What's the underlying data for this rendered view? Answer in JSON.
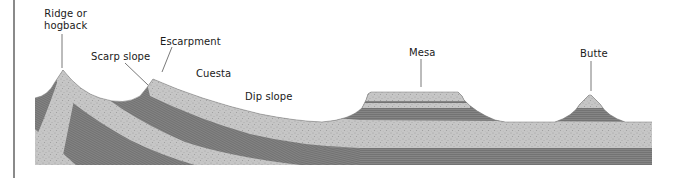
{
  "diagram": {
    "type": "geological-cross-section",
    "labels": {
      "ridge": "Ridge or\nhogback",
      "ridge_line1": "Ridge or",
      "ridge_line2": "hogback",
      "escarpment": "Escarpment",
      "scarp_slope": "Scarp slope",
      "cuesta": "Cuesta",
      "dip_slope": "Dip slope",
      "mesa": "Mesa",
      "butte": "Butte"
    },
    "colors": {
      "sandstone": "#c4c4c4",
      "sandstone_speckle": "#a8a8a8",
      "shale": "#7f7f7f",
      "shale_line": "#6e6e6e",
      "leader_line": "#555555",
      "frame": "#8a8a8a"
    }
  }
}
